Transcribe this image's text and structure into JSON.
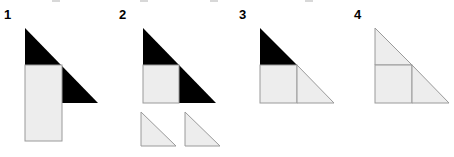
{
  "page": {
    "background_color": "#ffffff"
  },
  "colors": {
    "black_fill": "#000000",
    "light_fill": "#ededed",
    "stroke": "#9a9a9a",
    "label_text": "#000000"
  },
  "figures": [
    {
      "label": "1",
      "label_x": 4,
      "label_y": 8,
      "name": "figure-1-black-triangle-with-overlapping-rectangle",
      "parts": [
        {
          "name": "black-right-triangle",
          "shape": "triangle",
          "fill": "black_fill",
          "stroked": false,
          "points": "25,28 25,103 98,103"
        },
        {
          "name": "light-rectangle",
          "shape": "rectangle",
          "fill": "light_fill",
          "stroked": true,
          "x": 25,
          "y": 65,
          "width": 37,
          "height": 76
        }
      ]
    },
    {
      "label": "2",
      "label_x": 119,
      "label_y": 8,
      "name": "figure-2-black-triangle-with-square-and-two-loose-triangles",
      "parts": [
        {
          "name": "black-right-triangle",
          "shape": "triangle",
          "fill": "black_fill",
          "stroked": false,
          "points": "143,28 143,103 216,103"
        },
        {
          "name": "light-square-inset",
          "shape": "rectangle",
          "fill": "light_fill",
          "stroked": true,
          "x": 143,
          "y": 65,
          "width": 36,
          "height": 38
        },
        {
          "name": "loose-triangle-left",
          "shape": "triangle",
          "fill": "light_fill",
          "stroked": true,
          "points": "141,112 141,146 176,146"
        },
        {
          "name": "loose-triangle-right",
          "shape": "triangle",
          "fill": "light_fill",
          "stroked": true,
          "points": "185,112 185,146 220,146"
        }
      ]
    },
    {
      "label": "3",
      "label_x": 239,
      "label_y": 8,
      "name": "figure-3-triangle-with-black-top-and-light-bottom-row",
      "parts": [
        {
          "name": "black-top-triangle",
          "shape": "triangle",
          "fill": "black_fill",
          "stroked": false,
          "points": "260,28 260,65 297,65"
        },
        {
          "name": "light-square",
          "shape": "rectangle",
          "fill": "light_fill",
          "stroked": true,
          "x": 260,
          "y": 65,
          "width": 37,
          "height": 38
        },
        {
          "name": "light-bottom-right-triangle",
          "shape": "triangle",
          "fill": "light_fill",
          "stroked": true,
          "points": "297,65 297,103 334,103"
        }
      ]
    },
    {
      "label": "4",
      "label_x": 354,
      "label_y": 8,
      "name": "figure-4-all-light-triangle-partitioned",
      "parts": [
        {
          "name": "light-top-triangle",
          "shape": "triangle",
          "fill": "light_fill",
          "stroked": true,
          "points": "375,28 375,65 412,65"
        },
        {
          "name": "light-square",
          "shape": "rectangle",
          "fill": "light_fill",
          "stroked": true,
          "x": 375,
          "y": 65,
          "width": 37,
          "height": 38
        },
        {
          "name": "light-bottom-right-triangle",
          "shape": "triangle",
          "fill": "light_fill",
          "stroked": true,
          "points": "412,65 412,103 449,103"
        }
      ]
    }
  ]
}
